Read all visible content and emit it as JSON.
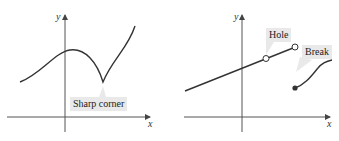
{
  "figures": [
    {
      "id": "left",
      "description": "Continuous curve with a sharp corner (cusp)",
      "axes": {
        "x_label": "x",
        "y_label": "y"
      },
      "annotations": [
        {
          "text": "Sharp corner"
        }
      ]
    },
    {
      "id": "right",
      "description": "Line with a hole and a break (jump discontinuity)",
      "axes": {
        "x_label": "x",
        "y_label": "y"
      },
      "annotations": [
        {
          "text": "Hole"
        },
        {
          "text": "Break"
        }
      ]
    }
  ],
  "colors": {
    "curve": "#333333",
    "axis": "#444444",
    "label_bg": "#e9e9e9"
  }
}
